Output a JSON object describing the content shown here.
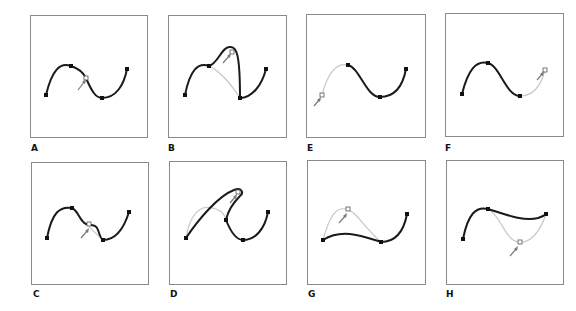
{
  "figure": {
    "panels": [
      {
        "id": "A",
        "label": "A",
        "description": "Original path with pointer at midpoint of segment"
      },
      {
        "id": "B",
        "label": "B",
        "description": "Segment dragged upward; previous segment shown gray"
      },
      {
        "id": "C",
        "label": "C",
        "description": "Segment dragged slightly down; previous segment shown gray"
      },
      {
        "id": "D",
        "label": "D",
        "description": "First segment dragged up and right; previous shape gray"
      },
      {
        "id": "E",
        "label": "E",
        "description": "First segment selected (gray) with pointer at lower left"
      },
      {
        "id": "F",
        "label": "F",
        "description": "Last segment selected (gray) with pointer at upper right"
      },
      {
        "id": "G",
        "label": "G",
        "description": "First segment reshaped lower; previous arch shown gray"
      },
      {
        "id": "H",
        "label": "H",
        "description": "Last segment reshaped upward; previous dip shown gray"
      }
    ],
    "colors": {
      "frame": "#8a8a8a",
      "path": "#1a1a1a",
      "previous_path": "#c8c8c8",
      "anchor": "#111111",
      "pointer": "#7a7a7a"
    }
  }
}
